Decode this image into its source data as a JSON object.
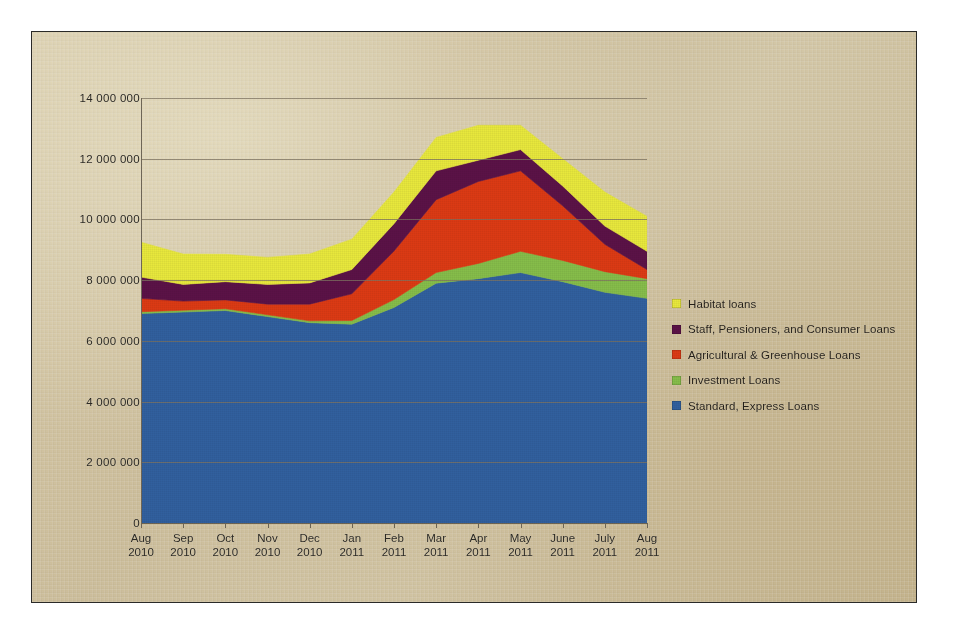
{
  "chart_data": {
    "type": "area",
    "stacked": true,
    "title": "",
    "subtitle": "",
    "xlabel": "",
    "ylabel": "",
    "grid": true,
    "legend_position": "right",
    "ylim": [
      0,
      14000000
    ],
    "ytick_step": 2000000,
    "ytick_labels": [
      "14 000 000",
      "12 000 000",
      "10 000 000",
      "8 000 000",
      "6 000 000",
      "4 000 000",
      "2 000 000",
      "0"
    ],
    "ytick_values": [
      14000000,
      12000000,
      10000000,
      8000000,
      6000000,
      4000000,
      2000000,
      0
    ],
    "categories": [
      "Aug 2010",
      "Sep 2010",
      "Oct 2010",
      "Nov 2010",
      "Dec 2010",
      "Jan 2011",
      "Feb 2011",
      "Mar 2011",
      "Apr 2011",
      "May 2011",
      "June 2011",
      "July 2011",
      "Aug 2011"
    ],
    "xtick_labels": [
      {
        "month": "Aug",
        "year": "2010"
      },
      {
        "month": "Sep",
        "year": "2010"
      },
      {
        "month": "Oct",
        "year": "2010"
      },
      {
        "month": "Nov",
        "year": "2010"
      },
      {
        "month": "Dec",
        "year": "2010"
      },
      {
        "month": "Jan",
        "year": "2011"
      },
      {
        "month": "Feb",
        "year": "2011"
      },
      {
        "month": "Mar",
        "year": "2011"
      },
      {
        "month": "Apr",
        "year": "2011"
      },
      {
        "month": "May",
        "year": "2011"
      },
      {
        "month": "June",
        "year": "2011"
      },
      {
        "month": "July",
        "year": "2011"
      },
      {
        "month": "Aug",
        "year": "2011"
      }
    ],
    "series": [
      {
        "name": "Standard, Express Loans",
        "color": "#31609E",
        "stack_order": 1,
        "values": [
          6900000,
          6950000,
          7000000,
          6800000,
          6600000,
          6550000,
          7100000,
          7900000,
          8050000,
          8250000,
          7950000,
          7600000,
          7400000
        ]
      },
      {
        "name": "Investment Loans",
        "color": "#86BD4A",
        "stack_order": 2,
        "values": [
          60000,
          60000,
          60000,
          60000,
          60000,
          120000,
          260000,
          350000,
          500000,
          700000,
          700000,
          680000,
          650000
        ]
      },
      {
        "name": "Agricultural & Greenhouse Loans",
        "color": "#DC3A14",
        "stack_order": 3,
        "values": [
          440000,
          300000,
          290000,
          350000,
          550000,
          880000,
          1600000,
          2400000,
          2700000,
          2650000,
          1800000,
          900000,
          300000
        ]
      },
      {
        "name": "Staff, Pensioners, and Consumer Loans",
        "color": "#5B1247",
        "stack_order": 4,
        "values": [
          700000,
          550000,
          600000,
          650000,
          700000,
          800000,
          900000,
          950000,
          700000,
          700000,
          650000,
          600000,
          600000
        ]
      },
      {
        "name": "Habitat loans",
        "color": "#E8E83C",
        "stack_order": 5,
        "values": [
          1150000,
          1000000,
          900000,
          890000,
          950000,
          1000000,
          1040000,
          1100000,
          1150000,
          800000,
          900000,
          1120000,
          1150000
        ]
      }
    ],
    "totals": [
      9250000,
      8860000,
      8850000,
      8750000,
      8860000,
      9350000,
      10900000,
      12700000,
      13100000,
      13100000,
      12000000,
      10900000,
      10100000
    ],
    "legend": [
      {
        "label": "Habitat loans",
        "color": "#E8E83C"
      },
      {
        "label": "Staff, Pensioners, and Consumer Loans",
        "color": "#5B1247"
      },
      {
        "label": "Agricultural & Greenhouse Loans",
        "color": "#DC3A14"
      },
      {
        "label": "Investment Loans",
        "color": "#86BD4A"
      },
      {
        "label": "Standard, Express Loans",
        "color": "#31609E"
      }
    ]
  },
  "colors": {
    "habitat": "#E8E83C",
    "staff": "#5B1247",
    "agricultural": "#DC3A14",
    "investment": "#86BD4A",
    "standard": "#31609E",
    "paper": "#d8c9a4",
    "axis": "#6f6757",
    "frame": "#2a2a28"
  }
}
